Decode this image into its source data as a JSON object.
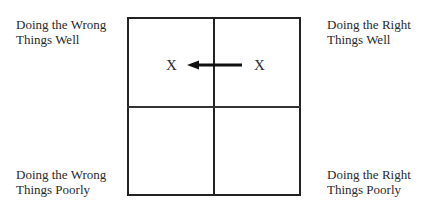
{
  "quadrants": {
    "top_left": {
      "line1": "Doing the Wrong",
      "line2": "Things Well"
    },
    "top_right": {
      "line1": "Doing the Right",
      "line2": "Things Well"
    },
    "bottom_left": {
      "line1": "Doing the Wrong",
      "line2": "Things Poorly"
    },
    "bottom_right": {
      "line1": "Doing the Right",
      "line2": "Things Poorly"
    }
  },
  "markers": {
    "from": "X",
    "to": "X"
  },
  "arrow": {
    "direction": "left",
    "color": "#111111"
  }
}
